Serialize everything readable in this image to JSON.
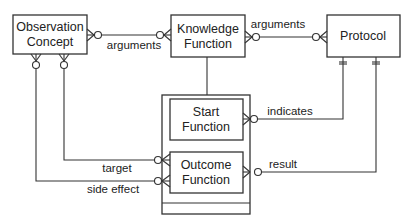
{
  "diagram": {
    "type": "entity-relationship",
    "entities": [
      {
        "id": "observation_concept",
        "line1": "Observation",
        "line2": "Concept"
      },
      {
        "id": "knowledge_function",
        "line1": "Knowledge",
        "line2": "Function"
      },
      {
        "id": "protocol",
        "line1": "Protocol"
      },
      {
        "id": "start_function",
        "line1": "Start",
        "line2": "Function"
      },
      {
        "id": "outcome_function",
        "line1": "Outcome",
        "line2": "Function"
      }
    ],
    "relationships": [
      {
        "id": "arguments_1",
        "label": "arguments",
        "from": "Observation Concept",
        "to": "Knowledge Function",
        "notation": "zero-or-many to zero-or-many"
      },
      {
        "id": "arguments_2",
        "label": "arguments",
        "from": "Knowledge Function",
        "to": "Protocol",
        "notation": "zero-or-many to zero-or-many"
      },
      {
        "id": "indicates",
        "label": "indicates",
        "from": "Start Function",
        "to": "Protocol",
        "notation": "zero-or-many to exactly-one"
      },
      {
        "id": "result",
        "label": "result",
        "from": "Outcome Function",
        "to": "Protocol",
        "notation": "zero-or-many to exactly-one"
      },
      {
        "id": "target",
        "label": "target",
        "from": "Outcome Function",
        "to": "Observation Concept",
        "notation": "zero-or-many to zero-or-many"
      },
      {
        "id": "side_effect",
        "label": "side effect",
        "from": "Outcome Function",
        "to": "Observation Concept",
        "notation": "zero-or-many to zero-or-many"
      }
    ],
    "generalization": {
      "supertype": "Knowledge Function",
      "subtypes": [
        "Start Function",
        "Outcome Function"
      ]
    }
  }
}
